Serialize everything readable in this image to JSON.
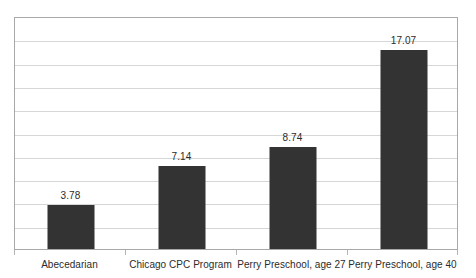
{
  "chart_data": {
    "type": "bar",
    "title": "",
    "subtitle": "",
    "xlabel": "",
    "ylabel": "",
    "categories": [
      "Abecedarian",
      "Chicago CPC Program",
      "Perry Preschool, age 27",
      "Perry Preschool, age 40"
    ],
    "values": [
      3.78,
      7.14,
      8.74,
      17.07
    ],
    "data_labels": [
      "3.78",
      "7.14",
      "8.74",
      "17.07"
    ],
    "ylim": [
      0,
      20
    ],
    "y_tick_interval": 2,
    "y_ticks": [
      0,
      2,
      4,
      6,
      8,
      10,
      12,
      14,
      16,
      18,
      20
    ],
    "y_tick_labels_visible": false,
    "gridlines": {
      "horizontal": true,
      "vertical": false,
      "count": 10,
      "color": "#d6d6d6"
    },
    "legend": {
      "visible": false,
      "position": "none",
      "entries": []
    },
    "series": [
      {
        "name": "Benefit-cost ratio",
        "values": [
          3.78,
          7.14,
          8.74,
          17.07
        ],
        "color": "#333333"
      }
    ],
    "colors": {
      "bar": "#333333",
      "gridline": "#d6d6d6",
      "plot_border": "#a8a8a8",
      "text": "#2b2b2b",
      "background": "#ffffff",
      "axis_tick": "#b5b5b5"
    },
    "bar_count": 4
  }
}
